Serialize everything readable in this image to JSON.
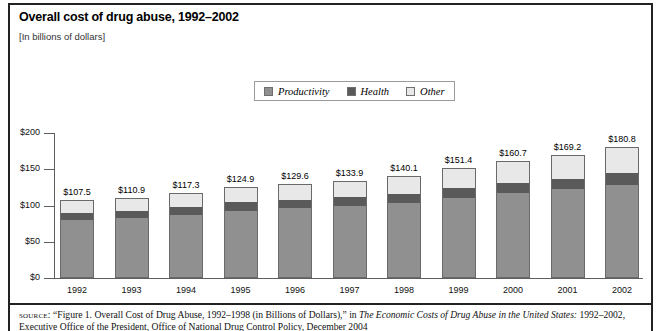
{
  "header": {
    "title": "Overall cost of drug abuse, 1992–2002",
    "subtitle": "[In billions of dollars]"
  },
  "legend": {
    "items": [
      {
        "label": "Productivity",
        "color": "#909090"
      },
      {
        "label": "Health",
        "color": "#5a5a5a"
      },
      {
        "label": "Other",
        "color": "#e8e8e8"
      }
    ]
  },
  "axis": {
    "y_ticks": [
      "$200",
      "$150",
      "$100",
      "$50",
      "$0"
    ]
  },
  "source": {
    "kicker": "source:",
    "text_before_italic": "“Figure 1. Overall Cost of Drug Abuse, 1992–1998 (in Billions of Dollars),” in ",
    "italic_title": "The Economic Costs of Drug Abuse in the United States:",
    "line_two": "1992–2002, Executive Office of the President, Office of National Drug Control Policy, December 2004"
  },
  "chart_data": {
    "type": "bar",
    "subtype": "stacked-column",
    "title": "Overall cost of drug abuse, 1992–2002",
    "subtitle": "[In billions of dollars]",
    "xlabel": "",
    "ylabel": "",
    "ylim": [
      0,
      200
    ],
    "yticks": [
      0,
      50,
      100,
      150,
      200
    ],
    "ytick_labels": [
      "$0",
      "$50",
      "$100",
      "$150",
      "$200"
    ],
    "grid": false,
    "legend_position": "top-center",
    "categories": [
      "1992",
      "1993",
      "1994",
      "1995",
      "1996",
      "1997",
      "1998",
      "1999",
      "2000",
      "2001",
      "2002"
    ],
    "series": [
      {
        "name": "Productivity",
        "color": "#909090",
        "values": [
          80.1,
          82.8,
          87.4,
          92.9,
          96.4,
          99.1,
          103.5,
          110.4,
          117.0,
          122.3,
          128.6
        ]
      },
      {
        "name": "Health",
        "color": "#5a5a5a",
        "values": [
          9.8,
          10.1,
          10.6,
          11.3,
          11.7,
          12.1,
          12.6,
          13.2,
          14.1,
          14.9,
          15.9
        ]
      },
      {
        "name": "Other",
        "color": "#e8e8e8",
        "values": [
          17.6,
          18.0,
          19.3,
          20.7,
          21.5,
          22.7,
          24.0,
          27.8,
          29.6,
          32.0,
          36.3
        ]
      }
    ],
    "totals": [
      107.5,
      110.9,
      117.3,
      124.9,
      129.6,
      133.9,
      140.1,
      151.4,
      160.7,
      169.2,
      180.8
    ],
    "total_labels": [
      "$107.5",
      "$110.9",
      "$117.3",
      "$124.9",
      "$129.6",
      "$133.9",
      "$140.1",
      "$151.4",
      "$160.7",
      "$169.2",
      "$180.8"
    ]
  }
}
